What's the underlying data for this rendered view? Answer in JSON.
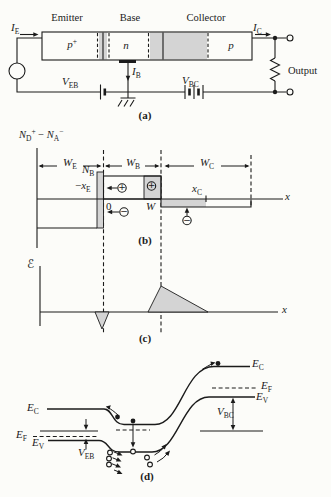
{
  "colors": {
    "ink": "#1b1b1b",
    "shade": "#d4d4d4",
    "background": "#fcfcf9"
  },
  "signs": {
    "plus": "+",
    "minus": "−"
  },
  "part_a": {
    "caption": "(a)",
    "region_labels": {
      "emitter": "Emitter",
      "base": "Base",
      "collector": "Collector"
    },
    "doping": {
      "emitter_main": "p",
      "emitter_sup": "+",
      "base": "n",
      "collector": "p"
    },
    "i_e": {
      "main": "I",
      "sub": "E"
    },
    "i_c": {
      "main": "I",
      "sub": "C"
    },
    "i_b": {
      "main": "I",
      "sub": "B"
    },
    "v_eb": {
      "main": "V",
      "sub": "EB"
    },
    "v_bc": {
      "main": "V",
      "sub": "BC"
    },
    "output": "Output"
  },
  "part_b": {
    "caption": "(b)",
    "y_axis_label": {
      "n1": "N",
      "sub1": "D",
      "sup1": "+",
      "minus": " − ",
      "n2": "N",
      "sub2": "A",
      "sup2": "−"
    },
    "x_axis_label": "x",
    "w_e": {
      "main": "W",
      "sub": "E"
    },
    "w_b": {
      "main": "W",
      "sub": "B"
    },
    "w_c": {
      "main": "W",
      "sub": "C"
    },
    "n_b": {
      "main": "N",
      "sub": "B"
    },
    "minus_x_e": {
      "pre": "−",
      "main": "x",
      "sub": "E"
    },
    "origin": "0",
    "w_point": "W",
    "x_c": {
      "main": "x",
      "sub": "C"
    }
  },
  "part_c": {
    "caption": "(c)",
    "y_axis_label": "ℰ",
    "x_axis_label": "x"
  },
  "part_d": {
    "caption": "(d)",
    "e_c_left": {
      "main": "E",
      "sub": "C"
    },
    "e_f_left": {
      "main": "E",
      "sub": "F"
    },
    "e_v_left": {
      "main": "E",
      "sub": "V"
    },
    "v_eb": {
      "main": "V",
      "sub": "EB"
    },
    "e_c_right": {
      "main": "E",
      "sub": "C"
    },
    "e_f_right": {
      "main": "E",
      "sub": "F"
    },
    "e_v_right": {
      "main": "E",
      "sub": "V"
    },
    "v_bc": {
      "main": "V",
      "sub": "BC"
    }
  }
}
